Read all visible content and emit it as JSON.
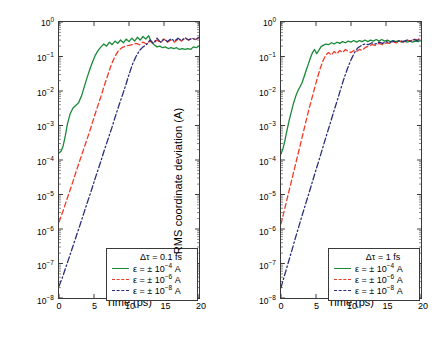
{
  "figure": {
    "axis_labels": {
      "x": "Time (ps)",
      "y": "RMS coordinate deviation (A)"
    },
    "colors": {
      "green": "#1a8a38",
      "red": "#ee3b28",
      "blue": "#2b2f7a",
      "axis": "#3a3a3a"
    }
  },
  "chart_data": [
    {
      "type": "line",
      "panel": "left",
      "title": "",
      "xlabel": "Time (ps)",
      "ylabel": "RMS coordinate deviation (A)",
      "xlim": [
        0,
        20
      ],
      "ylim": [
        1e-08,
        1
      ],
      "yscale": "log",
      "xticks": [
        0,
        5,
        10,
        15,
        20
      ],
      "yticks": [
        "10^0",
        "10^-1",
        "10^-2",
        "10^-3",
        "10^-4",
        "10^-5",
        "10^-6",
        "10^-7",
        "10^-8"
      ],
      "grid": false,
      "legend_position": "lower-right",
      "legend_title": "Δτ = 0.1 fs",
      "series": [
        {
          "name": "ε = ± 10^-4 A",
          "style": "solid",
          "color": "#1a8a38",
          "x": [
            0,
            0.3,
            0.6,
            0.9,
            1.2,
            1.6,
            2,
            2.4,
            2.8,
            3.2,
            3.6,
            4,
            4.4,
            4.8,
            5.2,
            5.6,
            6,
            6.4,
            6.8,
            7.2,
            7.6,
            8,
            8.4,
            8.8,
            9.2,
            9.6,
            10,
            10.4,
            10.8,
            11.2,
            11.6,
            12,
            12.4,
            12.8,
            13.2,
            13.6,
            14,
            14.4,
            14.8,
            15.2,
            15.6,
            16,
            16.4,
            16.8,
            17.2,
            17.6,
            18,
            18.4,
            18.8,
            19.2,
            19.6,
            20
          ],
          "y": [
            0.00016,
            0.00018,
            0.00026,
            0.0005,
            0.0011,
            0.0022,
            0.0032,
            0.0038,
            0.0046,
            0.007,
            0.013,
            0.024,
            0.042,
            0.07,
            0.11,
            0.15,
            0.19,
            0.23,
            0.2,
            0.26,
            0.22,
            0.28,
            0.24,
            0.3,
            0.25,
            0.32,
            0.27,
            0.34,
            0.28,
            0.36,
            0.3,
            0.38,
            0.32,
            0.4,
            0.26,
            0.22,
            0.19,
            0.2,
            0.18,
            0.19,
            0.17,
            0.18,
            0.17,
            0.18,
            0.16,
            0.17,
            0.16,
            0.17,
            0.16,
            0.19,
            0.18,
            0.2
          ]
        },
        {
          "name": "ε = ± 10^-6 A",
          "style": "dashed",
          "color": "#ee3b28",
          "x": [
            0,
            0.5,
            1,
            1.5,
            2,
            2.5,
            3,
            3.5,
            4,
            4.5,
            5,
            5.5,
            6,
            6.5,
            7,
            7.5,
            8,
            8.5,
            9,
            9.5,
            10,
            10.5,
            11,
            11.5,
            12,
            12.5,
            13,
            13.5,
            14,
            14.5,
            15,
            15.5,
            16,
            16.5,
            17,
            17.5,
            18,
            18.5,
            19,
            19.5,
            20
          ],
          "y": [
            1.6e-06,
            3e-06,
            6e-06,
            1.2e-05,
            2.4e-05,
            5e-05,
            0.0001,
            0.0002,
            0.0004,
            0.0008,
            0.0017,
            0.0035,
            0.007,
            0.015,
            0.03,
            0.06,
            0.1,
            0.15,
            0.18,
            0.2,
            0.21,
            0.22,
            0.24,
            0.22,
            0.26,
            0.23,
            0.28,
            0.24,
            0.3,
            0.25,
            0.32,
            0.26,
            0.3,
            0.26,
            0.32,
            0.28,
            0.34,
            0.3,
            0.33,
            0.31,
            0.36
          ]
        },
        {
          "name": "ε = ± 10^-8 A",
          "style": "dashdot",
          "color": "#2b2f7a",
          "x": [
            0,
            0.5,
            1,
            1.5,
            2,
            2.5,
            3,
            3.5,
            4,
            4.5,
            5,
            5.5,
            6,
            6.5,
            7,
            7.5,
            8,
            8.5,
            9,
            9.5,
            10,
            10.5,
            11,
            11.5,
            12,
            12.5,
            13,
            13.5,
            14,
            14.5,
            15,
            15.5,
            16,
            16.5,
            17,
            17.5,
            18,
            18.5,
            19,
            19.5,
            20
          ],
          "y": [
            2.2e-08,
            4e-08,
            8e-08,
            1.6e-07,
            3.2e-07,
            6.5e-07,
            1.3e-06,
            2.7e-06,
            5.5e-06,
            1.1e-05,
            2.3e-05,
            4.7e-05,
            9.5e-05,
            0.0002,
            0.0004,
            0.0008,
            0.0017,
            0.0035,
            0.007,
            0.014,
            0.03,
            0.06,
            0.1,
            0.15,
            0.19,
            0.22,
            0.3,
            0.24,
            0.34,
            0.26,
            0.32,
            0.27,
            0.33,
            0.28,
            0.34,
            0.29,
            0.35,
            0.3,
            0.34,
            0.31,
            0.36
          ]
        }
      ]
    },
    {
      "type": "line",
      "panel": "right",
      "title": "",
      "xlabel": "Time (ps)",
      "ylabel": "RMS coordinate deviation (A)",
      "xlim": [
        0,
        20
      ],
      "ylim": [
        1e-08,
        1
      ],
      "yscale": "log",
      "xticks": [
        0,
        5,
        10,
        15,
        20
      ],
      "yticks": [
        "10^0",
        "10^-1",
        "10^-2",
        "10^-3",
        "10^-4",
        "10^-5",
        "10^-6",
        "10^-7",
        "10^-8"
      ],
      "grid": false,
      "legend_position": "lower-right",
      "legend_title": "Δτ = 1 fs",
      "series": [
        {
          "name": "ε = ± 10^-4 A",
          "style": "solid",
          "color": "#1a8a38",
          "x": [
            0,
            0.3,
            0.6,
            0.9,
            1.2,
            1.5,
            1.8,
            2.1,
            2.4,
            2.7,
            3,
            3.3,
            3.6,
            3.9,
            4.2,
            4.5,
            4.8,
            5.1,
            5.4,
            5.7,
            6,
            6.4,
            6.8,
            7.2,
            7.6,
            8,
            8.4,
            8.8,
            9.2,
            9.6,
            10,
            10.4,
            10.8,
            11.2,
            11.6,
            12,
            12.4,
            12.8,
            13.2,
            13.6,
            14,
            14.4,
            14.8,
            15.2,
            15.6,
            16,
            16.4,
            16.8,
            17.2,
            17.6,
            18,
            18.4,
            18.8,
            19.2,
            19.6,
            20
          ],
          "y": [
            0.00015,
            0.00022,
            0.0004,
            0.0008,
            0.0015,
            0.0026,
            0.0045,
            0.007,
            0.01,
            0.013,
            0.017,
            0.026,
            0.04,
            0.06,
            0.09,
            0.13,
            0.16,
            0.12,
            0.15,
            0.19,
            0.21,
            0.23,
            0.22,
            0.25,
            0.23,
            0.26,
            0.24,
            0.27,
            0.25,
            0.28,
            0.26,
            0.29,
            0.26,
            0.29,
            0.27,
            0.3,
            0.27,
            0.3,
            0.28,
            0.31,
            0.28,
            0.31,
            0.28,
            0.3,
            0.27,
            0.29,
            0.27,
            0.29,
            0.26,
            0.28,
            0.26,
            0.28,
            0.26,
            0.28,
            0.27,
            0.29
          ]
        },
        {
          "name": "ε = ± 10^-6 A",
          "style": "dashed",
          "color": "#ee3b28",
          "x": [
            0,
            0.4,
            0.8,
            1.2,
            1.6,
            2,
            2.4,
            2.8,
            3.2,
            3.6,
            4,
            4.4,
            4.8,
            5.2,
            5.6,
            6,
            6.4,
            6.8,
            7.2,
            7.6,
            8,
            8.4,
            8.8,
            9.2,
            9.6,
            10,
            10.4,
            10.8,
            11.2,
            11.6,
            12,
            12.5,
            13,
            13.5,
            14,
            14.5,
            15,
            15.5,
            16,
            16.5,
            17,
            17.5,
            18,
            18.5,
            19,
            19.5,
            20
          ],
          "y": [
            1.4e-06,
            3e-06,
            6.5e-06,
            1.4e-05,
            3e-05,
            6.5e-05,
            0.00014,
            0.0003,
            0.00065,
            0.0014,
            0.003,
            0.006,
            0.012,
            0.024,
            0.045,
            0.075,
            0.11,
            0.13,
            0.11,
            0.14,
            0.12,
            0.15,
            0.13,
            0.16,
            0.14,
            0.13,
            0.15,
            0.14,
            0.16,
            0.15,
            0.18,
            0.2,
            0.22,
            0.21,
            0.24,
            0.22,
            0.25,
            0.24,
            0.27,
            0.25,
            0.28,
            0.26,
            0.3,
            0.28,
            0.32,
            0.3,
            0.36
          ]
        },
        {
          "name": "ε = ± 10^-8 A",
          "style": "dashdot",
          "color": "#2b2f7a",
          "x": [
            0,
            0.5,
            1,
            1.5,
            2,
            2.5,
            3,
            3.5,
            4,
            4.5,
            5,
            5.5,
            6,
            6.5,
            7,
            7.5,
            8,
            8.5,
            9,
            9.5,
            10,
            10.5,
            11,
            11.5,
            12,
            12.5,
            13,
            13.5,
            14,
            14.5,
            15,
            15.5,
            16,
            16.5,
            17,
            17.5,
            18,
            18.5,
            19,
            19.5,
            20
          ],
          "y": [
            2e-08,
            4.5e-08,
            1e-07,
            2.2e-07,
            5e-07,
            1.1e-06,
            2.4e-06,
            5.2e-06,
            1.1e-05,
            2.4e-05,
            5.2e-05,
            0.00011,
            0.00024,
            0.00052,
            0.0011,
            0.0024,
            0.005,
            0.011,
            0.023,
            0.045,
            0.08,
            0.13,
            0.18,
            0.21,
            0.23,
            0.22,
            0.25,
            0.23,
            0.26,
            0.24,
            0.27,
            0.25,
            0.28,
            0.26,
            0.29,
            0.27,
            0.3,
            0.28,
            0.31,
            0.29,
            0.33
          ]
        }
      ]
    }
  ]
}
